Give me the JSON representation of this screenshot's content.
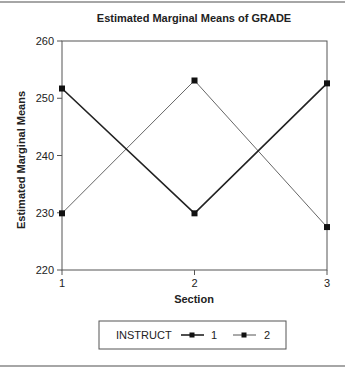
{
  "chart_data": {
    "type": "line",
    "title": "Estimated Marginal Means of GRADE",
    "xlabel": "Section",
    "ylabel": "Estimated Marginal Means",
    "categories": [
      "1",
      "2",
      "3"
    ],
    "x": [
      1,
      2,
      3
    ],
    "ylim": [
      220,
      260
    ],
    "yticks": [
      220,
      230,
      240,
      250,
      260
    ],
    "yticks_labels": [
      "220",
      "230",
      "240",
      "250",
      "260"
    ],
    "xticks_labels": [
      "1",
      "2",
      "3"
    ],
    "grid": false,
    "legend": {
      "title": "INSTRUCT",
      "position": "bottom",
      "entries": [
        "1",
        "2"
      ]
    },
    "series": [
      {
        "name": "1",
        "values": [
          251.7,
          229.9,
          252.6
        ],
        "color": "#222222",
        "stroke_width": 1.6,
        "marker": "square"
      },
      {
        "name": "2",
        "values": [
          229.9,
          253.1,
          227.5
        ],
        "color": "#555555",
        "stroke_width": 0.9,
        "marker": "square"
      }
    ]
  },
  "layout": {
    "plot": {
      "left": 62,
      "right": 327,
      "top": 41,
      "bottom": 270
    },
    "frame_color": "#555555",
    "rule_color": "#888888"
  }
}
